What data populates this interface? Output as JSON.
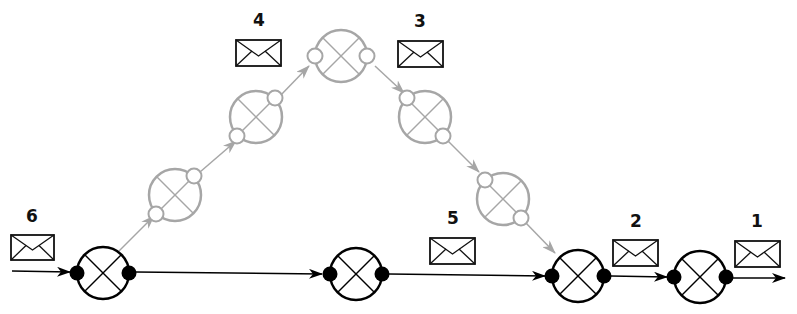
{
  "diagram": {
    "colors": {
      "active": "#000000",
      "inactive": "#a6a6a6",
      "envelope": "#111111"
    },
    "labels": {
      "msg1": "1",
      "msg2": "2",
      "msg3": "3",
      "msg4": "4",
      "msg5": "5",
      "msg6": "6"
    },
    "nodes": [
      {
        "id": "A",
        "state": "active"
      },
      {
        "id": "B",
        "state": "active"
      },
      {
        "id": "C",
        "state": "active"
      },
      {
        "id": "D",
        "state": "active"
      },
      {
        "id": "G1",
        "state": "inactive"
      },
      {
        "id": "G2",
        "state": "inactive"
      },
      {
        "id": "G3",
        "state": "inactive"
      },
      {
        "id": "G4",
        "state": "inactive"
      },
      {
        "id": "G5",
        "state": "inactive"
      }
    ],
    "messages": [
      {
        "label": "6",
        "icon": "envelope-icon"
      },
      {
        "label": "4",
        "icon": "envelope-icon"
      },
      {
        "label": "3",
        "icon": "envelope-icon"
      },
      {
        "label": "5",
        "icon": "envelope-icon"
      },
      {
        "label": "2",
        "icon": "envelope-icon"
      },
      {
        "label": "1",
        "icon": "envelope-icon"
      }
    ]
  }
}
